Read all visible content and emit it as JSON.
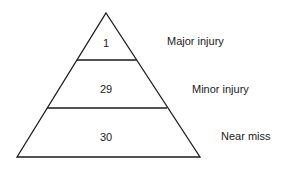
{
  "diagram": {
    "type": "pyramid",
    "tiers": [
      {
        "value": "1",
        "label": "Major injury"
      },
      {
        "value": "29",
        "label": "Minor injury"
      },
      {
        "value": "30",
        "label": "Near miss"
      }
    ],
    "line_color": "#1a1a1a"
  }
}
